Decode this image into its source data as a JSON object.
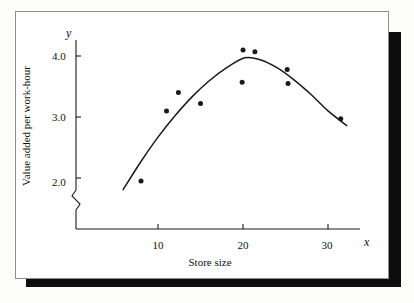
{
  "figure": {
    "kind": "scatter-with-fitted-curve",
    "background_color": "#fdfdfc",
    "card_color": "#ffffff",
    "shadow_color": "#0d0d0d",
    "border_color": "#8e8e8e",
    "ink_color": "#1a1a1a"
  },
  "chart_data": {
    "type": "scatter",
    "title": "",
    "xlabel": "Store size",
    "ylabel": "Value added per work-hour",
    "x_axis_symbol": "x",
    "y_axis_symbol": "y",
    "xlim": [
      4,
      34
    ],
    "ylim": [
      1.7,
      4.35
    ],
    "xticks": [
      10,
      20,
      30
    ],
    "xtick_labels": [
      "10",
      "20",
      "30"
    ],
    "yticks": [
      2.0,
      3.0,
      4.0
    ],
    "ytick_labels": [
      "2.0",
      "3.0",
      "4.0"
    ],
    "grid": false,
    "legend": false,
    "y_axis_break": true,
    "points": [
      {
        "x": 8.0,
        "y": 1.95
      },
      {
        "x": 11.0,
        "y": 3.1
      },
      {
        "x": 12.4,
        "y": 3.4
      },
      {
        "x": 15.0,
        "y": 3.22
      },
      {
        "x": 19.9,
        "y": 3.57
      },
      {
        "x": 20.0,
        "y": 4.1
      },
      {
        "x": 21.4,
        "y": 4.07
      },
      {
        "x": 25.2,
        "y": 3.78
      },
      {
        "x": 25.3,
        "y": 3.55
      },
      {
        "x": 31.5,
        "y": 2.97
      }
    ],
    "fitted_curve": {
      "kind": "quadratic",
      "x_start": 5.9,
      "x_end": 32.2,
      "vertex_x": 20.2,
      "vertex_y": 3.97,
      "points": [
        {
          "x": 5.9,
          "y": 1.81
        },
        {
          "x": 8.0,
          "y": 2.27
        },
        {
          "x": 10.0,
          "y": 2.67
        },
        {
          "x": 12.0,
          "y": 3.02
        },
        {
          "x": 14.0,
          "y": 3.33
        },
        {
          "x": 16.0,
          "y": 3.59
        },
        {
          "x": 18.0,
          "y": 3.8
        },
        {
          "x": 20.2,
          "y": 3.97
        },
        {
          "x": 22.0,
          "y": 3.94
        },
        {
          "x": 24.0,
          "y": 3.81
        },
        {
          "x": 26.0,
          "y": 3.61
        },
        {
          "x": 28.0,
          "y": 3.37
        },
        {
          "x": 30.0,
          "y": 3.1
        },
        {
          "x": 32.2,
          "y": 2.86
        }
      ]
    }
  }
}
